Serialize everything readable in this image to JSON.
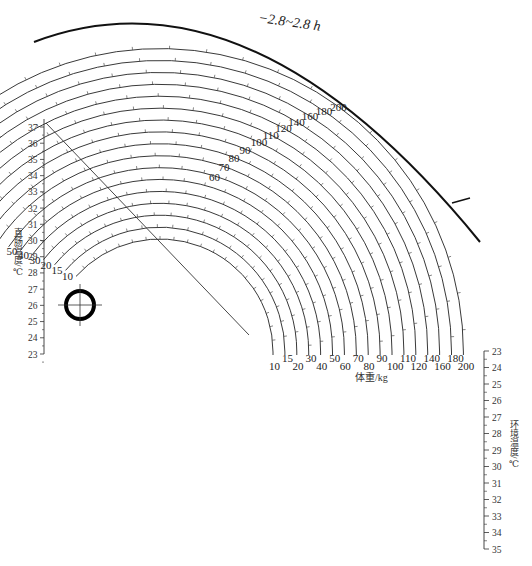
{
  "figure": {
    "top_arc_label": "−2.8~2.8 h",
    "left_axis": {
      "label": "直肠温度/℃",
      "ticks": [
        37,
        36,
        35,
        34,
        33,
        32,
        31,
        30,
        29,
        28,
        27,
        26,
        25,
        24,
        23
      ]
    },
    "right_axis": {
      "label": "环境温度/℃",
      "ticks": [
        23,
        24,
        25,
        26,
        27,
        28,
        29,
        30,
        31,
        32,
        33,
        34,
        35
      ]
    },
    "weight_axis": {
      "label": "体重/kg",
      "upper_row": [
        "15",
        "30",
        "50",
        "70",
        "90",
        "110",
        "140",
        "180"
      ],
      "lower_row": [
        "10",
        "20",
        "40",
        "60",
        "80",
        "100",
        "120",
        "160",
        "200"
      ]
    },
    "weight_arcs": [
      10,
      15,
      20,
      30,
      40,
      50,
      60,
      70,
      80,
      90,
      100,
      110,
      120,
      140,
      160,
      180,
      200
    ],
    "arc_start_labels": [
      "10",
      "15",
      "20",
      "30",
      "40",
      "50"
    ],
    "arc_mid_labels": [
      "60",
      "70",
      "80",
      "90",
      "100",
      "110",
      "120",
      "140",
      "160",
      "180",
      "200"
    ],
    "time_scale_labels": [
      "1",
      "2",
      "3",
      "4",
      "5",
      "6",
      "8",
      "10",
      "12",
      "14",
      "15",
      "16",
      "18",
      "20",
      "25",
      "30"
    ],
    "reference_marker": "crosshair-circle"
  }
}
